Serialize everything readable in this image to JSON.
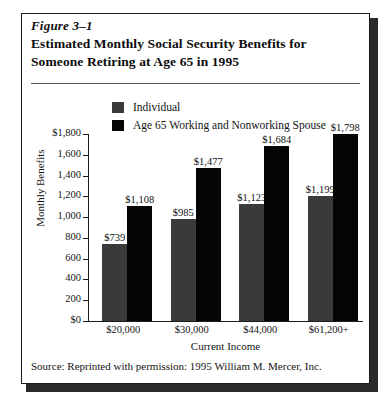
{
  "figure": {
    "number": "Figure 3–1",
    "title_line1": "Estimated Monthly Social Security Benefits for",
    "title_line2": "Someone Retiring at Age 65 in 1995",
    "source": "Source:  Reprinted with permission:  1995 William M. Mercer, Inc."
  },
  "colors": {
    "individual": "#3a3a3a",
    "spouse": "#050505",
    "axis": "#1c1c1c",
    "text": "#141414",
    "frame": "#1a1a1a",
    "shadow": "#2a2a2a",
    "background": "#ffffff"
  },
  "chart_data": {
    "type": "bar",
    "title": "Estimated Monthly Social Security Benefits for Someone Retiring at Age 65 in 1995",
    "xlabel": "Current Income",
    "ylabel": "Monthly Benefits",
    "categories": [
      "$20,000",
      "$30,000",
      "$44,000",
      "$61,200+"
    ],
    "series": [
      {
        "name": "Individual",
        "color": "#3a3a3a",
        "values": [
          739,
          985,
          1123,
          1199
        ],
        "labels": [
          "$739",
          "$985",
          "$1,123",
          "$1,199"
        ]
      },
      {
        "name": "Age 65 Working and Nonworking Spouse",
        "color": "#050505",
        "values": [
          1108,
          1477,
          1684,
          1798
        ],
        "labels": [
          "$1,108",
          "$1,477",
          "$1,684",
          "$1,798"
        ]
      }
    ],
    "ylim": [
      0,
      1800
    ],
    "ytick_values": [
      0,
      200,
      400,
      600,
      800,
      1000,
      1200,
      1400,
      1600,
      1800
    ],
    "ytick_labels": [
      "$0",
      "200",
      "400",
      "600",
      "800",
      "1,000",
      "1,200",
      "1,400",
      "1,600",
      "$1,800"
    ],
    "grid": false,
    "legend_position": "top-center"
  }
}
